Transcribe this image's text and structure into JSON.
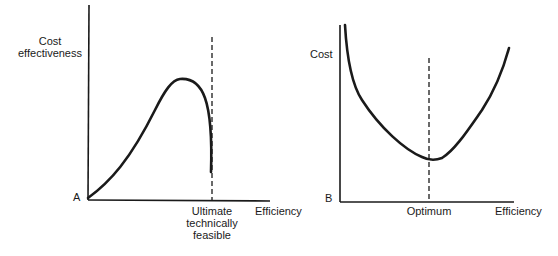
{
  "left_diagram": {
    "y_label_line1": "Cost",
    "y_label_line2": "effectiveness",
    "origin_label": "A",
    "x_label": "Efficiency",
    "marker_label_line1": "Ultimate",
    "marker_label_line2": "technically",
    "marker_label_line3": "feasible"
  },
  "right_diagram": {
    "y_label": "Cost",
    "origin_label": "B",
    "x_label": "Efficiency",
    "marker_label": "Optimum"
  },
  "colors": {
    "ink": "#1a1a1a",
    "background": "#ffffff"
  }
}
